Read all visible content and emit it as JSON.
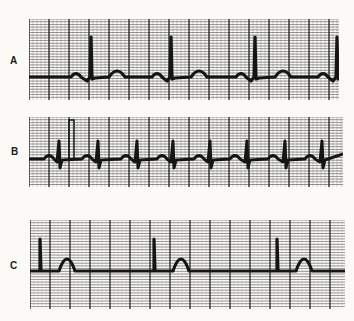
{
  "figure": {
    "colors": {
      "background": "#fbfaf6",
      "grid_minor": "#3a3a3a",
      "grid_major": "#1a1a1a",
      "trace": "#151515"
    },
    "strips": [
      {
        "label": "A",
        "x": 29,
        "y": 19,
        "w": 310,
        "h": 81,
        "baseline": 58,
        "major": 20,
        "minor": 4,
        "beats": [
          {
            "p": 47,
            "r": 62,
            "t": 88
          },
          {
            "p": 128,
            "r": 142,
            "t": 170
          },
          {
            "p": 212,
            "r": 226,
            "t": 254
          },
          {
            "p": 294,
            "r": 308,
            "t": 0
          }
        ],
        "r_height": 40
      },
      {
        "label": "B",
        "x": 29,
        "y": 117,
        "w": 314,
        "h": 70,
        "baseline": 42,
        "major": 20,
        "minor": 4,
        "beats": [
          {
            "p": 20,
            "r": 30
          },
          {
            "p": 58,
            "r": 69
          },
          {
            "p": 97,
            "r": 108
          },
          {
            "p": 133,
            "r": 144
          },
          {
            "p": 170,
            "r": 181
          },
          {
            "p": 206,
            "r": 218
          },
          {
            "p": 244,
            "r": 256
          },
          {
            "p": 281,
            "r": 293
          }
        ],
        "r_height": 18,
        "cal_pulse_x": 40
      },
      {
        "label": "C",
        "x": 30,
        "y": 220,
        "w": 315,
        "h": 89,
        "baseline": 51,
        "major": 20,
        "minor": 4,
        "beats": [
          {
            "r": 10,
            "t": 37
          },
          {
            "r": 124,
            "t": 151
          },
          {
            "r": 247,
            "t": 274
          }
        ],
        "r_height": 32
      }
    ]
  }
}
